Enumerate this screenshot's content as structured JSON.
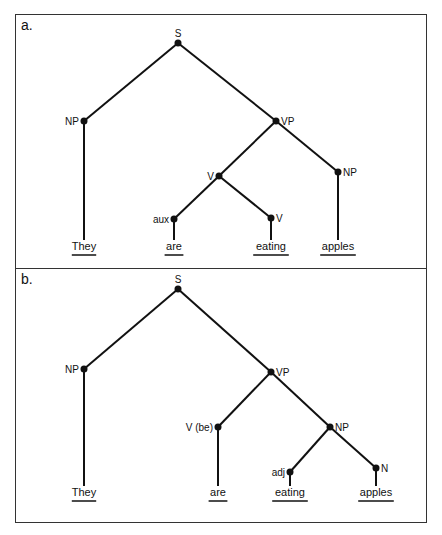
{
  "panels": [
    {
      "label": "a.",
      "nodes": {
        "S": {
          "label": "S",
          "x": 178,
          "y": 43
        },
        "NP1": {
          "label": "NP",
          "x": 84,
          "y": 121
        },
        "VP": {
          "label": "VP",
          "x": 276,
          "y": 121
        },
        "V": {
          "label": "V",
          "x": 219,
          "y": 176
        },
        "NP2": {
          "label": "NP",
          "x": 338,
          "y": 172
        },
        "aux": {
          "label": "aux",
          "x": 174,
          "y": 219
        },
        "V2": {
          "label": "V",
          "x": 271,
          "y": 218
        }
      },
      "edges": [
        [
          "S",
          "NP1"
        ],
        [
          "S",
          "VP"
        ],
        [
          "VP",
          "V"
        ],
        [
          "VP",
          "NP2"
        ],
        [
          "V",
          "aux"
        ],
        [
          "V",
          "V2"
        ]
      ],
      "words": [
        {
          "text": "They",
          "x": 84,
          "attach": "NP1"
        },
        {
          "text": "are",
          "x": 174,
          "attach": "aux"
        },
        {
          "text": "eating",
          "x": 271,
          "attach": "V2"
        },
        {
          "text": "apples",
          "x": 338,
          "attach": "NP2"
        }
      ],
      "word_y": 250
    },
    {
      "label": "b.",
      "nodes": {
        "S": {
          "label": "S",
          "x": 178,
          "y": 289
        },
        "NP1": {
          "label": "NP",
          "x": 84,
          "y": 369
        },
        "VP": {
          "label": "VP",
          "x": 271,
          "y": 372
        },
        "Vbe": {
          "label": "V (be)",
          "x": 218,
          "y": 427
        },
        "NP2": {
          "label": "NP",
          "x": 330,
          "y": 427
        },
        "adj": {
          "label": "adj",
          "x": 290,
          "y": 472
        },
        "N": {
          "label": "N",
          "x": 376,
          "y": 468
        }
      },
      "edges": [
        [
          "S",
          "NP1"
        ],
        [
          "S",
          "VP"
        ],
        [
          "VP",
          "Vbe"
        ],
        [
          "VP",
          "NP2"
        ],
        [
          "NP2",
          "adj"
        ],
        [
          "NP2",
          "N"
        ]
      ],
      "words": [
        {
          "text": "They",
          "x": 84,
          "attach": "NP1"
        },
        {
          "text": "are",
          "x": 218,
          "attach": "Vbe"
        },
        {
          "text": "eating",
          "x": 290,
          "attach": "adj"
        },
        {
          "text": "apples",
          "x": 376,
          "attach": "N"
        }
      ],
      "word_y": 496
    }
  ],
  "label_positions": {
    "S": "above",
    "NP1": "left",
    "VP": "right",
    "V": "left",
    "NP2": "right",
    "aux": "left",
    "V2": "right",
    "Vbe": "left",
    "adj": "left",
    "N": "right"
  },
  "colors": {
    "line": "#111111",
    "border": "#333333",
    "text": "#111111"
  }
}
